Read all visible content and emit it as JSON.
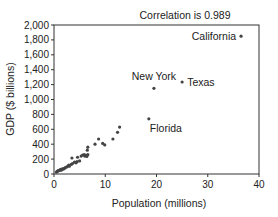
{
  "chart_data": {
    "type": "scatter",
    "title": "Correlation is 0.989",
    "xlabel": "Population (millions)",
    "ylabel": "GDP ($ billions)",
    "xlim": [
      0,
      40
    ],
    "ylim": [
      0,
      2000
    ],
    "xticks": [
      0,
      10,
      20,
      30,
      40
    ],
    "xtick_labels": [
      "0",
      "10",
      "20",
      "30",
      "40"
    ],
    "yticks": [
      0,
      200,
      400,
      600,
      800,
      1000,
      1200,
      1400,
      1600,
      1800,
      2000
    ],
    "ytick_labels": [
      "0",
      "200",
      "400",
      "600",
      "800",
      "1,000",
      "1,200",
      "1,400",
      "1,600",
      "1,800",
      "2,000"
    ],
    "grid": false,
    "legend": null,
    "point_color": "#444444",
    "points": [
      {
        "x": 0.5,
        "y": 25
      },
      {
        "x": 0.6,
        "y": 35
      },
      {
        "x": 0.7,
        "y": 40
      },
      {
        "x": 0.9,
        "y": 45
      },
      {
        "x": 1.0,
        "y": 50
      },
      {
        "x": 1.2,
        "y": 55
      },
      {
        "x": 1.3,
        "y": 60
      },
      {
        "x": 1.4,
        "y": 50
      },
      {
        "x": 1.6,
        "y": 70
      },
      {
        "x": 1.8,
        "y": 65
      },
      {
        "x": 2.0,
        "y": 75
      },
      {
        "x": 2.2,
        "y": 85
      },
      {
        "x": 2.5,
        "y": 95
      },
      {
        "x": 2.8,
        "y": 110
      },
      {
        "x": 2.9,
        "y": 120
      },
      {
        "x": 3.0,
        "y": 105
      },
      {
        "x": 3.4,
        "y": 130
      },
      {
        "x": 3.6,
        "y": 140
      },
      {
        "x": 3.5,
        "y": 215
      },
      {
        "x": 4.0,
        "y": 160
      },
      {
        "x": 4.3,
        "y": 150
      },
      {
        "x": 4.5,
        "y": 165
      },
      {
        "x": 4.6,
        "y": 225
      },
      {
        "x": 5.0,
        "y": 175
      },
      {
        "x": 5.3,
        "y": 240
      },
      {
        "x": 5.6,
        "y": 255
      },
      {
        "x": 5.9,
        "y": 260
      },
      {
        "x": 6.0,
        "y": 240
      },
      {
        "x": 6.2,
        "y": 250
      },
      {
        "x": 6.4,
        "y": 235
      },
      {
        "x": 6.6,
        "y": 260
      },
      {
        "x": 6.5,
        "y": 320
      },
      {
        "x": 6.6,
        "y": 360
      },
      {
        "x": 8.0,
        "y": 400
      },
      {
        "x": 8.7,
        "y": 470
      },
      {
        "x": 9.5,
        "y": 410
      },
      {
        "x": 9.9,
        "y": 390
      },
      {
        "x": 11.5,
        "y": 470
      },
      {
        "x": 12.4,
        "y": 560
      },
      {
        "x": 12.8,
        "y": 630
      }
    ],
    "labeled_points": [
      {
        "label": "California",
        "x": 36.5,
        "y": 1850
      },
      {
        "label": "Texas",
        "x": 25.0,
        "y": 1235
      },
      {
        "label": "New York",
        "x": 19.5,
        "y": 1150
      },
      {
        "label": "Florida",
        "x": 18.5,
        "y": 740
      }
    ]
  }
}
